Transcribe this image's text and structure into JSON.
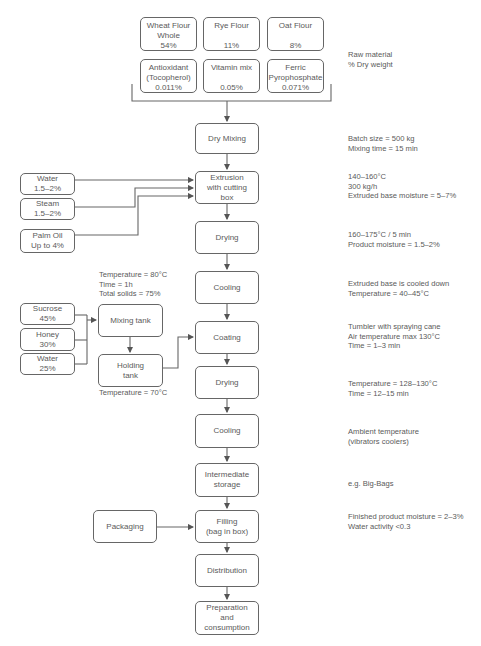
{
  "raw_materials": [
    {
      "name": "Wheat Flour Whole",
      "lines": [
        "Wheat Flour",
        "Whole",
        "54%"
      ]
    },
    {
      "name": "Rye Flour",
      "lines": [
        "Rye Flour",
        "",
        "11%"
      ]
    },
    {
      "name": "Oat Flour",
      "lines": [
        "Oat Flour",
        "",
        "8%"
      ]
    },
    {
      "name": "Antioxidant (Tocopherol)",
      "lines": [
        "Antioxidant",
        "(Tocopherol)",
        "0.011%"
      ]
    },
    {
      "name": "Vitamin mix",
      "lines": [
        "Vitamin mix",
        "",
        "0.05%"
      ]
    },
    {
      "name": "Ferric Pyrophosphate",
      "lines": [
        "Ferric",
        "Pyrophosphate",
        "0.071%"
      ]
    }
  ],
  "raw_material_note": [
    "Raw material",
    "% Dry weight"
  ],
  "main_steps": [
    {
      "id": "dry-mixing",
      "lines": [
        "Dry Mixing"
      ],
      "note": [
        "Batch size = 500 kg",
        "Mixing time = 15 min"
      ]
    },
    {
      "id": "extrusion",
      "lines": [
        "Extrusion",
        "with cutting",
        "box"
      ],
      "note": [
        "140–160°C",
        "300 kg/h",
        "Extruded base moisture = 5–7%"
      ]
    },
    {
      "id": "drying-1",
      "lines": [
        "Drying"
      ],
      "note": [
        "160–175°C / 5 min",
        "Product moisture = 1.5–2%"
      ]
    },
    {
      "id": "cooling-1",
      "lines": [
        "Cooling"
      ],
      "note": [
        "Extruded base is cooled down",
        "Temperature = 40–45°C"
      ]
    },
    {
      "id": "coating",
      "lines": [
        "Coating"
      ],
      "note": [
        "Tumbler with spraying cane",
        "Air temperature max 130°C",
        "Time = 1–3 min"
      ]
    },
    {
      "id": "drying-2",
      "lines": [
        "Drying"
      ],
      "note": [
        "Temperature = 128–130°C",
        "Time = 12–15 min"
      ]
    },
    {
      "id": "cooling-2",
      "lines": [
        "Cooling"
      ],
      "note": [
        "Ambient temperature",
        "(vibrators coolers)"
      ]
    },
    {
      "id": "intermediate-storage",
      "lines": [
        "Intermediate",
        "storage"
      ],
      "note": [
        "e.g. Big-Bags"
      ]
    },
    {
      "id": "filling",
      "lines": [
        "Filling",
        "(bag in box)"
      ],
      "note": [
        "Finished product moisture = 2–3%",
        "Water activity <0.3"
      ]
    },
    {
      "id": "distribution",
      "lines": [
        "Distribution"
      ],
      "note": []
    },
    {
      "id": "preparation",
      "lines": [
        "Preparation",
        "and",
        "consumption"
      ],
      "note": []
    }
  ],
  "extrusion_inputs": [
    {
      "lines": [
        "Water",
        "1.5–2%"
      ]
    },
    {
      "lines": [
        "Steam",
        "1.5–2%"
      ]
    },
    {
      "lines": [
        "Palm Oil",
        "Up to 4%"
      ]
    }
  ],
  "syrup_inputs": [
    {
      "lines": [
        "Sucrose",
        "45%"
      ]
    },
    {
      "lines": [
        "Honey",
        "30%"
      ]
    },
    {
      "lines": [
        "Water",
        "25%"
      ]
    }
  ],
  "mixing_tank": {
    "lines": [
      "Mixing tank"
    ],
    "note": [
      "Temperature = 80°C",
      "Time = 1h",
      "Total solids = 75%"
    ]
  },
  "holding_tank": {
    "lines": [
      "Holding",
      "tank"
    ],
    "note": [
      "Temperature = 70°C"
    ]
  },
  "packaging": {
    "lines": [
      "Packaging"
    ]
  }
}
